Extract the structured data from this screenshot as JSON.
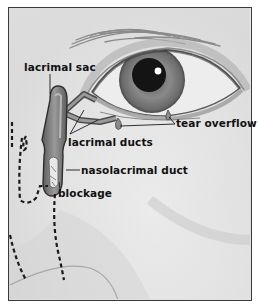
{
  "diagram": {
    "style": "grayscale medical illustration",
    "colors": {
      "frame_border": "#3a3a3a",
      "background": "#e6e6e6",
      "label_text": "#111111",
      "pupil": "#141414",
      "iris": "#7a7a7a",
      "duct": "#6e6e6e",
      "dashed_outline": "#1a1a1a"
    },
    "labels": [
      {
        "id": "lacrimal-sac",
        "text": "lacrimal sac"
      },
      {
        "id": "lacrimal-ducts",
        "text": "lacrimal ducts"
      },
      {
        "id": "tear-overflow",
        "text": "tear overflow"
      },
      {
        "id": "nasolacrimal-duct",
        "text": "nasolacrimal duct"
      },
      {
        "id": "blockage",
        "text": "blockage"
      }
    ]
  }
}
